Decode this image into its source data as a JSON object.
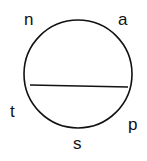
{
  "diagram": {
    "shape": "circle with horizontal chord",
    "labels": {
      "top_left": "n",
      "top_right": "a",
      "left": "t",
      "bottom_right": "p",
      "bottom": "s"
    },
    "stroke_color": "#111111",
    "background": "#ffffff"
  }
}
